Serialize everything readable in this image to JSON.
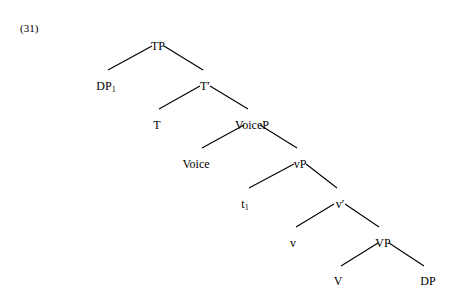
{
  "figure": {
    "example_number": "(31)",
    "nodes": [
      {
        "id": "TP",
        "label": "TP",
        "sub": "",
        "x": 158,
        "y": 40
      },
      {
        "id": "DP1",
        "label": "DP",
        "sub": "1",
        "x": 106,
        "y": 80
      },
      {
        "id": "Tbar",
        "label": "T′",
        "sub": "",
        "x": 205,
        "y": 80
      },
      {
        "id": "T",
        "label": "T",
        "sub": "",
        "x": 157,
        "y": 119
      },
      {
        "id": "VoiceP",
        "label": "VoiceP",
        "sub": "",
        "x": 252,
        "y": 119
      },
      {
        "id": "Voice",
        "label": "Voice",
        "sub": "",
        "x": 196,
        "y": 158
      },
      {
        "id": "vP",
        "label": "vP",
        "sub": "",
        "x": 300,
        "y": 158
      },
      {
        "id": "t1",
        "label": "t",
        "sub": "1",
        "x": 245,
        "y": 198
      },
      {
        "id": "vbar",
        "label": "v′",
        "sub": "",
        "x": 340,
        "y": 198
      },
      {
        "id": "v",
        "label": "v",
        "sub": "",
        "x": 293,
        "y": 237
      },
      {
        "id": "VP",
        "label": "VP",
        "sub": "",
        "x": 383,
        "y": 237
      },
      {
        "id": "V",
        "label": "V",
        "sub": "",
        "x": 338,
        "y": 275
      },
      {
        "id": "DP",
        "label": "DP",
        "sub": "",
        "x": 428,
        "y": 275
      }
    ],
    "branches": [
      {
        "from": "TP",
        "to": "DP1",
        "x1": 152,
        "y1": 46,
        "x2": 108,
        "y2": 70
      },
      {
        "from": "TP",
        "to": "Tbar",
        "x1": 164,
        "y1": 46,
        "x2": 203,
        "y2": 70
      },
      {
        "from": "Tbar",
        "to": "T",
        "x1": 200,
        "y1": 86,
        "x2": 159,
        "y2": 109
      },
      {
        "from": "Tbar",
        "to": "VoiceP",
        "x1": 210,
        "y1": 86,
        "x2": 248,
        "y2": 109
      },
      {
        "from": "VoiceP",
        "to": "Voice",
        "x1": 244,
        "y1": 125,
        "x2": 202,
        "y2": 148
      },
      {
        "from": "VoiceP",
        "to": "vP",
        "x1": 260,
        "y1": 125,
        "x2": 297,
        "y2": 148
      },
      {
        "from": "vP",
        "to": "t1",
        "x1": 294,
        "y1": 164,
        "x2": 249,
        "y2": 188
      },
      {
        "from": "vP",
        "to": "vbar",
        "x1": 306,
        "y1": 164,
        "x2": 337,
        "y2": 188
      },
      {
        "from": "vbar",
        "to": "v",
        "x1": 334,
        "y1": 204,
        "x2": 296,
        "y2": 227
      },
      {
        "from": "vbar",
        "to": "VP",
        "x1": 345,
        "y1": 204,
        "x2": 379,
        "y2": 227
      },
      {
        "from": "VP",
        "to": "V",
        "x1": 378,
        "y1": 243,
        "x2": 341,
        "y2": 266
      },
      {
        "from": "VP",
        "to": "DP",
        "x1": 389,
        "y1": 243,
        "x2": 424,
        "y2": 266
      }
    ],
    "colors": {
      "background": "#ffffff",
      "ink": "#000000"
    }
  }
}
